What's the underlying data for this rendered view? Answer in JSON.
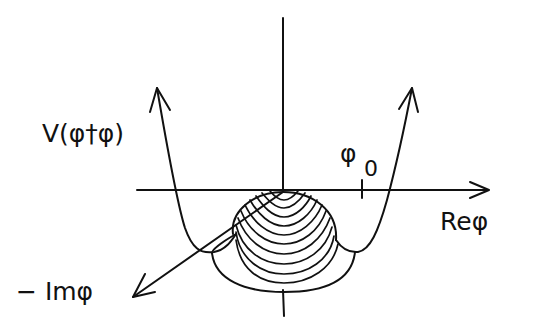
{
  "diagram": {
    "labels": {
      "potential": "V(φ†φ)",
      "vev": "φ",
      "vev_subscript": "0",
      "real_axis": "Reφ",
      "imag_axis": "− Imφ"
    },
    "elements": [
      "vertical-potential-axis",
      "horizontal-re-phi-axis",
      "oblique-im-phi-axis",
      "left-potential-branch-with-arrow",
      "right-potential-branch-with-arrow",
      "hemispherical-hump-with-contour-lines",
      "vev-tick-mark"
    ],
    "colors": {
      "ink": "#111111",
      "background": "#ffffff"
    }
  }
}
